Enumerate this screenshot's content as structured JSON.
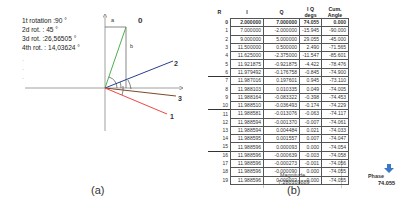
{
  "panel_a": {
    "rotations": [
      "1t rotation :90 °",
      "2d rot. : 45 °",
      "3d rot. :26,56505 °",
      "4th rot. : 14,03624 °"
    ],
    "ellipsis": [
      "·",
      "·",
      "·"
    ],
    "labels": {
      "a": "a",
      "b": "b",
      "v0": "0",
      "v1": "1",
      "v2": "2",
      "v3": "3"
    },
    "colors": {
      "v0": "#4caf50",
      "v1": "#f0463c",
      "v2": "#2a3f8f",
      "v3": "#7a4a2a",
      "axis": "#888888"
    },
    "caption": "(a)"
  },
  "panel_b": {
    "headers": [
      "R",
      "I",
      "Q",
      "I Q degs",
      "Cum. Angle"
    ],
    "rows": [
      [
        "0",
        "2.000000",
        "7.000000",
        "74.055",
        "0.000"
      ],
      [
        "1",
        "7.000000",
        "-2.000000",
        "-15.945",
        "-90.000"
      ],
      [
        "2",
        "9.000000",
        "5.000000",
        "29.055",
        "-45.000"
      ],
      [
        "3",
        "11.500000",
        "0.500000",
        "2.490",
        "-71.565"
      ],
      [
        "4",
        "11.625000",
        "-2.375000",
        "-11.547",
        "-85.601"
      ],
      [
        "5",
        "11.921875",
        "-0.921875",
        "-4.422",
        "-78.476"
      ],
      [
        "6",
        "11.979492",
        "-0.176758",
        "-0.845",
        "-74.900"
      ],
      [
        "7",
        "11.987016",
        "0.197601",
        "0.945",
        "-73.110"
      ],
      [
        "8",
        "11.988103",
        "0.010335",
        "0.049",
        "-74.005"
      ],
      [
        "9",
        "11.988164",
        "-0.083322",
        "-0.398",
        "-74.453"
      ],
      [
        "10",
        "11.988510",
        "-0.036493",
        "-0.174",
        "-74.229"
      ],
      [
        "11",
        "11.988581",
        "-0.013076",
        "-0.063",
        "-74.117"
      ],
      [
        "12",
        "11.988594",
        "-0.001370",
        "-0.007",
        "-74.061"
      ],
      [
        "13",
        "11.988594",
        "0.004484",
        "0.021",
        "-74.033"
      ],
      [
        "14",
        "11.988595",
        "0.001557",
        "0.007",
        "-74.047"
      ],
      [
        "15",
        "11.988596",
        "0.000093",
        "0.000",
        "-74.054"
      ],
      [
        "16",
        "11.988596",
        "-0.000639",
        "-0.003",
        "-74.058"
      ],
      [
        "17",
        "11.988596",
        "-0.000273",
        "-0.001",
        "-74.056"
      ],
      [
        "18",
        "11.988596",
        "-0.000090",
        "0.000",
        "-74.055"
      ],
      [
        "19",
        "11.988596",
        "0.000002",
        "0.000",
        "-74.055"
      ]
    ],
    "magnitude_label": "Magnitude",
    "magnitude_value": "7.280109889",
    "phase_label": "Phase",
    "phase_value": "74.055",
    "arrow_color": "#3a78c8",
    "caption": "(b)"
  }
}
